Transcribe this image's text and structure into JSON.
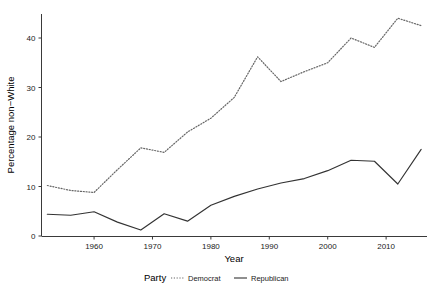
{
  "chart_data": {
    "type": "line",
    "title": "",
    "xlabel": "Year",
    "ylabel": "Percentage non−White",
    "xlim": [
      1951,
      2017
    ],
    "ylim": [
      -1.5,
      45.5
    ],
    "xticks": [
      1960,
      1970,
      1980,
      1990,
      2000,
      2010
    ],
    "xticklabels": [
      "1960",
      "1970",
      "1980",
      "1990",
      "2000",
      "2010"
    ],
    "yticks": [
      0,
      10,
      20,
      30,
      40
    ],
    "yticklabels": [
      "0",
      "10",
      "20",
      "30",
      "40"
    ],
    "grid": false,
    "legend_position": "bottom",
    "legend_title": "Party",
    "x": [
      1952,
      1956,
      1960,
      1964,
      1968,
      1972,
      1976,
      1980,
      1984,
      1988,
      1992,
      1996,
      2000,
      2004,
      2008,
      2012,
      2016
    ],
    "series": [
      {
        "name": "Democrat",
        "style": "dotted",
        "color": "#666666",
        "values": [
          10.2,
          9.2,
          8.8,
          13.4,
          17.8,
          16.9,
          21.0,
          23.8,
          28.0,
          36.2,
          31.2,
          33.2,
          35.0,
          40.0,
          38.1,
          44.0,
          42.5
        ]
      },
      {
        "name": "Republican",
        "style": "solid",
        "color": "#333333",
        "values": [
          4.4,
          4.2,
          4.9,
          2.8,
          1.2,
          4.5,
          3.0,
          6.2,
          8.0,
          9.5,
          10.7,
          11.6,
          13.2,
          15.3,
          15.1,
          10.5,
          17.5
        ]
      }
    ]
  },
  "axes": {
    "x_title": "Year",
    "y_title": "Percentage non−White"
  },
  "legend": {
    "title": "Party",
    "items": [
      {
        "label": "Democrat",
        "style": "dotted"
      },
      {
        "label": "Republican",
        "style": "solid"
      }
    ]
  }
}
